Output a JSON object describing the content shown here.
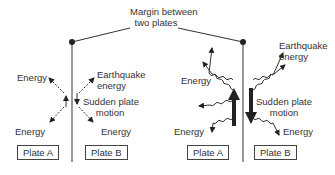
{
  "title": "Margin between two plates",
  "title_lines": [
    "Margin between",
    "two plates"
  ],
  "left_panel": {
    "labels": {
      "energy_top_left": "Energy",
      "earthquake_energy_line1": "Earthquake",
      "earthquake_energy_line2": "energy",
      "sudden_line1": "Sudden plate",
      "sudden_line2": "motion",
      "energy_bottom_left": "Energy",
      "energy_bottom_right": "Energy"
    },
    "plate_a": "Plate A",
    "plate_b": "Plate B"
  },
  "right_panel": {
    "labels": {
      "energy_left": "Energy",
      "earthquake_energy_line1": "Earthquake",
      "earthquake_energy_line2": "energy",
      "sudden_line1": "Sudden plate",
      "sudden_line2": "motion",
      "energy_bottom_left": "Energy",
      "energy_bottom_right": "Energy"
    },
    "plate_a": "Plate A",
    "plate_b": "Plate B"
  },
  "colors": {
    "line": "#333333",
    "text": "#333333"
  }
}
